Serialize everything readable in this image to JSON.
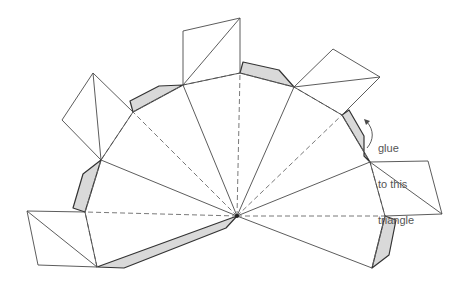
{
  "diagram": {
    "annotation": {
      "lines": [
        "glue",
        "to this",
        "triangle"
      ]
    },
    "colors": {
      "line": "#4a4a4a",
      "fold_line": "#6a6a6a",
      "glue_tab_fill": "#d9d9d9",
      "background": "#ffffff"
    },
    "legend": {
      "solid_line": "cut line",
      "dashed_line": "fold line",
      "shaded_region": "glue tab"
    }
  }
}
